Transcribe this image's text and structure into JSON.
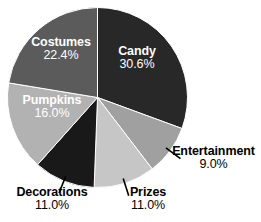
{
  "chart_data": {
    "type": "pie",
    "title": "",
    "subtitle": "",
    "xlabel": "",
    "ylabel": "",
    "grid": false,
    "legend_position": "none",
    "label_format": "name + percent",
    "start_angle_deg": 0,
    "direction": "clockwise",
    "categories": [
      "Candy",
      "Entertainment",
      "Prizes",
      "Decorations",
      "Pumpkins",
      "Costumes"
    ],
    "values": [
      30.6,
      9.0,
      11.0,
      11.0,
      16.0,
      22.4
    ],
    "units": "percent",
    "slices": [
      {
        "name": "Candy",
        "value": 30.6,
        "value_text": "30.6%",
        "color": "#282828",
        "label_color": "#ffffff",
        "label_placement": "inside",
        "has_leader_tick": false
      },
      {
        "name": "Entertainment",
        "value": 9.0,
        "value_text": "9.0%",
        "color": "#a0a0a0",
        "label_color": "#000000",
        "label_placement": "outside",
        "has_leader_tick": true
      },
      {
        "name": "Prizes",
        "value": 11.0,
        "value_text": "11.0%",
        "color": "#c6c6c6",
        "label_color": "#000000",
        "label_placement": "outside",
        "has_leader_tick": true
      },
      {
        "name": "Decorations",
        "value": 11.0,
        "value_text": "11.0%",
        "color": "#191919",
        "label_color": "#000000",
        "label_placement": "outside",
        "has_leader_tick": true
      },
      {
        "name": "Pumpkins",
        "value": 16.0,
        "value_text": "16.0%",
        "color": "#b2b2b2",
        "label_color": "#ffffff",
        "label_placement": "inside",
        "has_leader_tick": false
      },
      {
        "name": "Costumes",
        "value": 22.4,
        "value_text": "22.4%",
        "color": "#5b5b5b",
        "label_color": "#ffffff",
        "label_placement": "inside",
        "has_leader_tick": false
      }
    ]
  },
  "labels": {
    "candy": {
      "name": "Candy",
      "value": "30.6%"
    },
    "entertainment": {
      "name": "Entertainment",
      "value": "9.0%"
    },
    "prizes": {
      "name": "Prizes",
      "value": "11.0%"
    },
    "decorations": {
      "name": "Decorations",
      "value": "11.0%"
    },
    "pumpkins": {
      "name": "Pumpkins",
      "value": "16.0%"
    },
    "costumes": {
      "name": "Costumes",
      "value": "22.4%"
    }
  },
  "style": {
    "background": "#ffffff",
    "slice_separator_color": "#ffffff",
    "leader_tick_color": "#000000"
  }
}
